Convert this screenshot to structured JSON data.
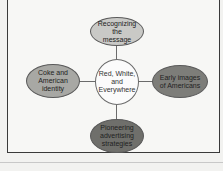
{
  "diagram": {
    "type": "concept-map",
    "center": {
      "label": "Red, White, and Everywhere",
      "color": "#fbfbfb"
    },
    "nodes": [
      {
        "position": "top",
        "label": "Recognizing the message",
        "color": "#c9c9c6"
      },
      {
        "position": "left",
        "label": "Coke and American identity",
        "color": "#a8a8a4"
      },
      {
        "position": "right",
        "label": "Early images of Americans",
        "color": "#7d7d79"
      },
      {
        "position": "bottom",
        "label": "Pioneering advertising strategies",
        "color": "#6f6f6b"
      }
    ]
  }
}
